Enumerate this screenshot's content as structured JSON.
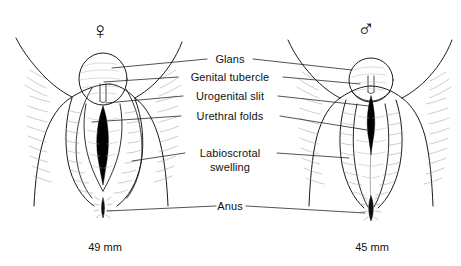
{
  "figure": {
    "kind": "anatomical-line-drawing",
    "title": "",
    "background_color": "#ffffff",
    "stroke_color": "#1a1a1a",
    "fill_color": "#000000"
  },
  "symbols": [
    {
      "name": "female-symbol",
      "glyph": "♀",
      "x": 100,
      "y": 31,
      "specimen": "left"
    },
    {
      "name": "male-symbol",
      "glyph": "♂",
      "x": 366,
      "y": 29,
      "specimen": "right"
    }
  ],
  "labels": [
    {
      "id": "glans",
      "text": "Glans",
      "x": 230,
      "y": 59,
      "lines": 1
    },
    {
      "id": "genital-tubercle",
      "text": "Genital tubercle",
      "x": 230,
      "y": 77,
      "lines": 1
    },
    {
      "id": "urogenital-slit",
      "text": "Urogenital slit",
      "x": 230,
      "y": 96,
      "lines": 1
    },
    {
      "id": "urethral-folds",
      "text": "Urethral folds",
      "x": 230,
      "y": 116,
      "lines": 1
    },
    {
      "id": "labioscrotal-swelling",
      "text": "Labioscrotal",
      "text2": "swelling",
      "x": 230,
      "y": 153,
      "lines": 2
    },
    {
      "id": "anus",
      "text": "Anus",
      "x": 230,
      "y": 206,
      "lines": 1
    }
  ],
  "measurements": [
    {
      "id": "left-length",
      "value": "49 mm",
      "x": 105,
      "y": 247,
      "specimen": "left"
    },
    {
      "id": "right-length",
      "value": "45 mm",
      "x": 372,
      "y": 247,
      "specimen": "right"
    }
  ],
  "specimens": [
    {
      "id": "female",
      "side": "left",
      "symbol": "♀",
      "size": "49 mm"
    },
    {
      "id": "male",
      "side": "right",
      "symbol": "♂",
      "size": "45 mm"
    }
  ]
}
